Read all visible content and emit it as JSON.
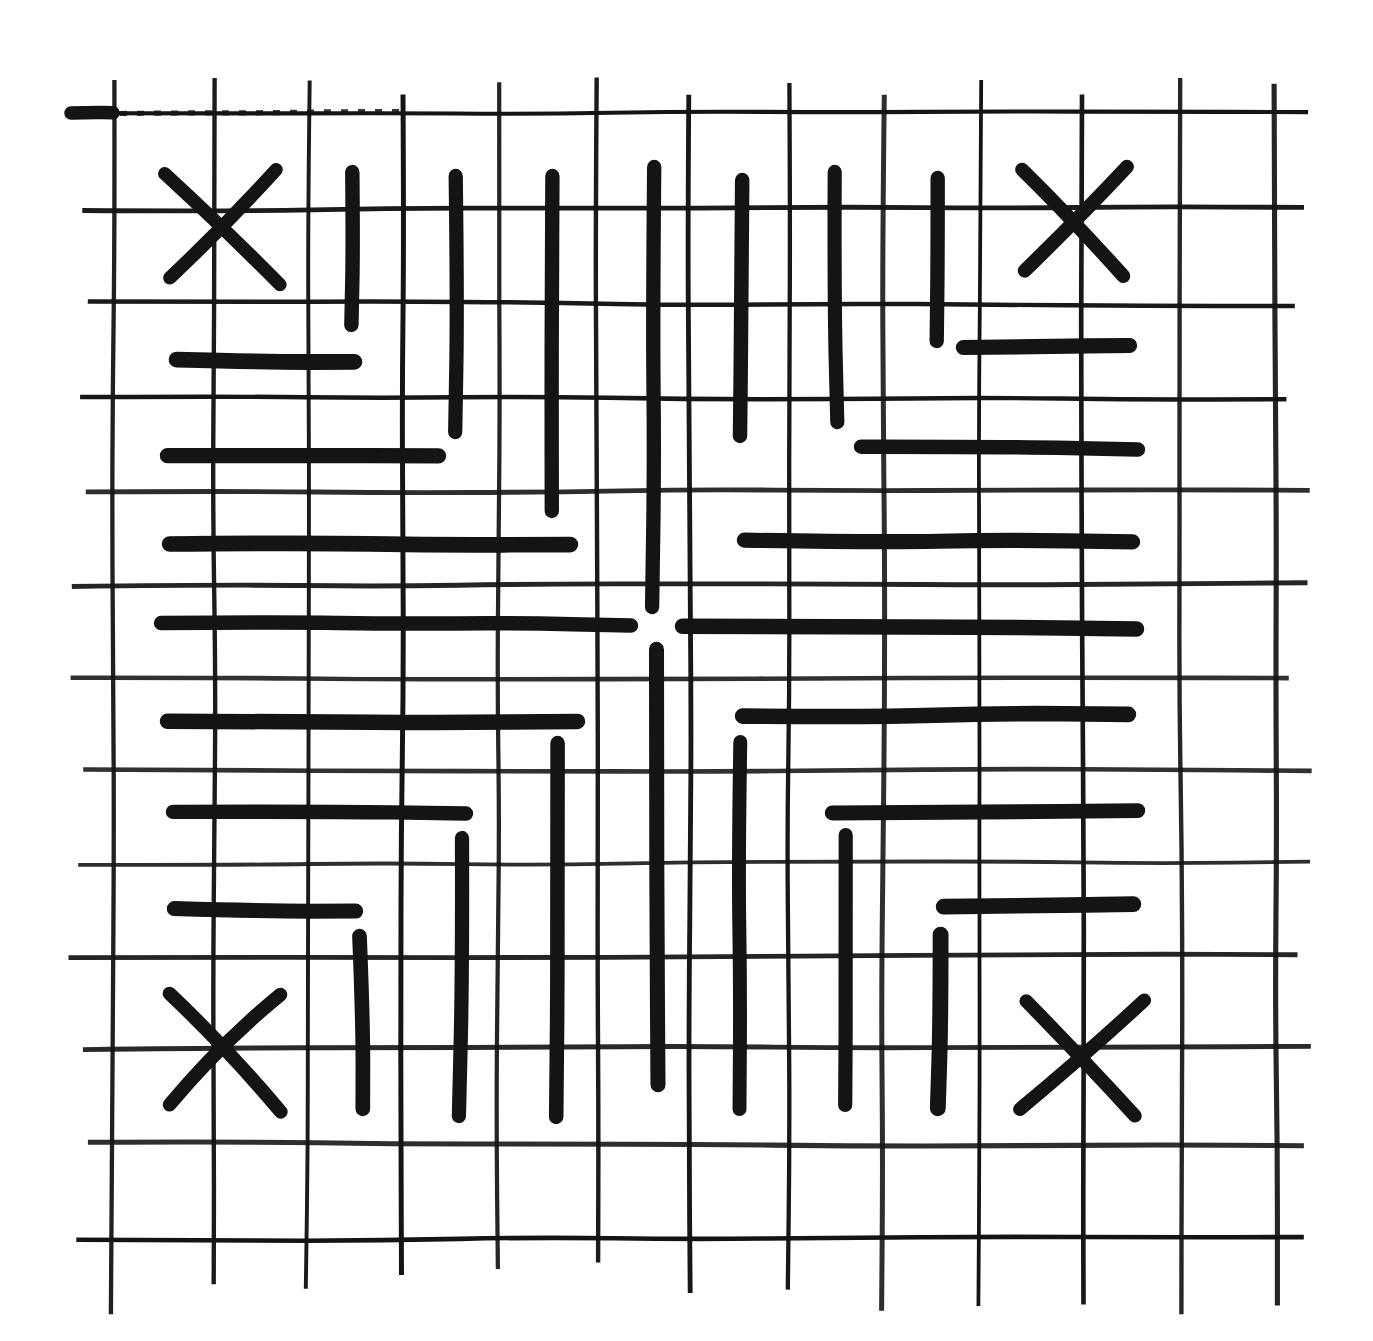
{
  "figure": {
    "kind": "hand-drawn-grid-fret-pattern",
    "canvas": {
      "width": 1373,
      "height": 1341,
      "paper_color": "#ffffff",
      "ink_color": "#141414"
    },
    "graph_paper": {
      "line_width": 4.5,
      "columns_x": [
        113,
        213,
        308,
        403,
        499,
        595,
        691,
        787,
        883,
        980,
        1083,
        1180,
        1276
      ],
      "rows_y": [
        113,
        208,
        303,
        397,
        490,
        584,
        677,
        770,
        863,
        956,
        1049,
        1143,
        1238
      ],
      "column_top_range": [
        74,
        97
      ],
      "column_bottom_range": [
        1253,
        1316
      ],
      "row_left_range": [
        66,
        88
      ],
      "row_right_range": [
        1286,
        1312
      ]
    },
    "thick_strokes": {
      "stroke_width": 15,
      "vertical": [
        {
          "x": 352,
          "y1": 166,
          "y2": 331
        },
        {
          "x": 456,
          "y1": 170,
          "y2": 438
        },
        {
          "x": 553,
          "y1": 170,
          "y2": 517
        },
        {
          "x": 655,
          "y1": 161,
          "y2": 613
        },
        {
          "x": 741,
          "y1": 174,
          "y2": 442
        },
        {
          "x": 836,
          "y1": 166,
          "y2": 428
        },
        {
          "x": 937,
          "y1": 172,
          "y2": 347
        },
        {
          "x": 655,
          "y1": 643,
          "y2": 1091
        },
        {
          "x": 360,
          "y1": 930,
          "y2": 1115
        },
        {
          "x": 460,
          "y1": 832,
          "y2": 1122
        },
        {
          "x": 557,
          "y1": 737,
          "y2": 1123
        },
        {
          "x": 741,
          "y1": 736,
          "y2": 1115
        },
        {
          "x": 847,
          "y1": 829,
          "y2": 1111
        },
        {
          "x": 939,
          "y1": 928,
          "y2": 1115
        }
      ],
      "horizontal": [
        {
          "y": 361,
          "x1": 170,
          "x2": 361
        },
        {
          "y": 454,
          "x1": 161,
          "x2": 445
        },
        {
          "y": 543,
          "x1": 163,
          "x2": 577
        },
        {
          "y": 624,
          "x1": 155,
          "x2": 637
        },
        {
          "y": 720,
          "x1": 161,
          "x2": 584
        },
        {
          "y": 813,
          "x1": 167,
          "x2": 472
        },
        {
          "y": 909,
          "x1": 168,
          "x2": 362
        },
        {
          "y": 346,
          "x1": 957,
          "x2": 1136
        },
        {
          "y": 447,
          "x1": 855,
          "x2": 1144
        },
        {
          "y": 541,
          "x1": 738,
          "x2": 1139
        },
        {
          "y": 626,
          "x1": 676,
          "x2": 1143
        },
        {
          "y": 716,
          "x1": 736,
          "x2": 1135
        },
        {
          "y": 811,
          "x1": 826,
          "x2": 1144
        },
        {
          "y": 906,
          "x1": 937,
          "x2": 1140
        }
      ]
    },
    "x_marks": {
      "stroke_width": 13.5,
      "marks": [
        {
          "cx": 225,
          "cy": 225,
          "arm": 56
        },
        {
          "cx": 1076,
          "cy": 220,
          "arm": 55
        },
        {
          "cx": 226,
          "cy": 1050,
          "arm": 58
        },
        {
          "cx": 1081,
          "cy": 1055,
          "arm": 59
        }
      ]
    },
    "margin_dash": {
      "y": 113,
      "x1": 66,
      "x2": 118,
      "width": 13.5
    },
    "scratch_overlay": {
      "y": 113,
      "x1": 120,
      "x2": 400
    }
  }
}
